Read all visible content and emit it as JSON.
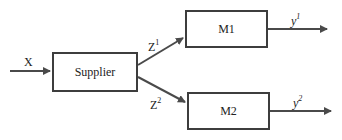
{
  "diagram": {
    "input": {
      "label": "X"
    },
    "supplier": {
      "label": "Supplier"
    },
    "m1": {
      "label": "M1"
    },
    "m2": {
      "label": "M2"
    },
    "z1": {
      "base": "Z",
      "sup": "1"
    },
    "z2": {
      "base": "Z",
      "sup": "2"
    },
    "y1": {
      "base": "y",
      "sup": "1"
    },
    "y2": {
      "base": "y",
      "sup": "2"
    }
  },
  "colors": {
    "line": "#4a4a4a",
    "border": "#3d3d3d",
    "text": "#222222"
  }
}
